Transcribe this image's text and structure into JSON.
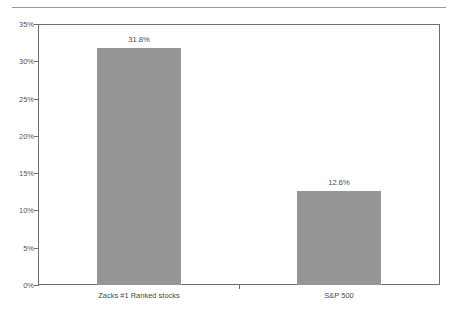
{
  "chart_data": {
    "type": "bar",
    "title": "",
    "subtitle": "",
    "xlabel": "",
    "ylabel": "",
    "categories": [
      "Zacks #1 Ranked stocks",
      "S&P 500"
    ],
    "values": [
      31.8,
      12.6
    ],
    "value_labels": [
      "31.8%",
      "12.6%"
    ],
    "ylim": [
      0,
      35
    ],
    "ytick_values": [
      0,
      5,
      10,
      15,
      20,
      25,
      30,
      35
    ],
    "ytick_labels": [
      "0%",
      "5%",
      "10%",
      "15%",
      "20%",
      "25%",
      "30%",
      "35%"
    ],
    "grid": false,
    "legend": "none",
    "series": [
      {
        "name": "Return",
        "values": [
          31.8,
          12.6
        ]
      }
    ],
    "colors": {
      "bar_fill": "#969696",
      "axis_line": "#6e6e6e",
      "tick_text": "#555555",
      "label_text": "#4a4a4a",
      "rule": "#9a9a9a",
      "background": "#ffffff"
    }
  }
}
